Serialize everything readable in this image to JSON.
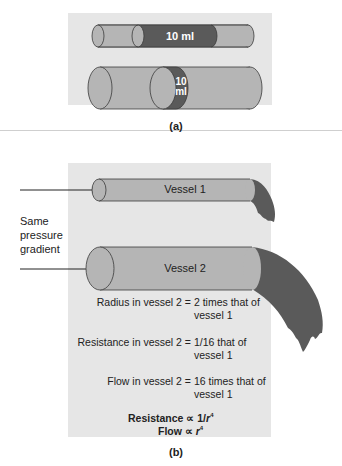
{
  "figure": {
    "panel_a": {
      "caption": "(a)",
      "small_tube_volume_label": "10 ml",
      "large_tube_volume_label_line1": "10",
      "large_tube_volume_label_line2": "ml"
    },
    "panel_b": {
      "caption": "(b)",
      "side_label_lines": [
        "Same",
        "pressure",
        "gradient"
      ],
      "vessel_1_label": "Vessel 1",
      "vessel_2_label": "Vessel 2",
      "statements": [
        {
          "lhs": "Radius in vessel 2 =",
          "rhs_line1": "2 times that of",
          "rhs_line2": "vessel 1"
        },
        {
          "lhs": "Resistance in vessel 2 =",
          "rhs_line1": "1/16 that of",
          "rhs_line2": "vessel 1"
        },
        {
          "lhs": "Flow in vessel 2 =",
          "rhs_line1": "16 times that of",
          "rhs_line2": "vessel 1"
        }
      ],
      "law_resistance_prefix": "Resistance ∝ 1/",
      "law_resistance_var": "r",
      "law_flow_prefix": "Flow ∝ ",
      "law_flow_var": "r",
      "exponent": "4"
    },
    "colors": {
      "panel_bg": "#e6e6e6",
      "tube_fill": "#b5b5b5",
      "tube_outline": "#3a3a3a",
      "fluid_dark": "#5a5a5a"
    }
  }
}
